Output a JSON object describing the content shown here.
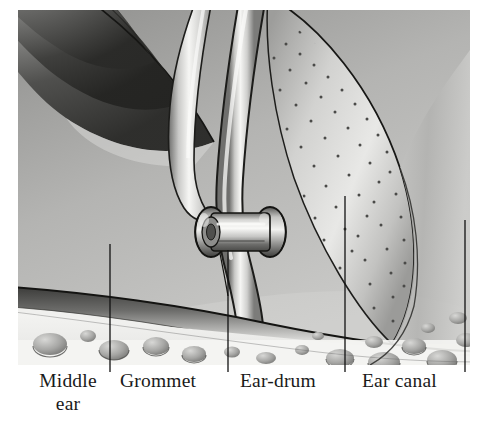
{
  "figure": {
    "type": "anatomical-illustration",
    "style": "grayscale pen-and-ink stipple drawing",
    "frame": {
      "x": 18,
      "y": 10,
      "width": 452,
      "height": 355
    }
  },
  "labels": [
    {
      "id": "middle-ear",
      "line1": "Middle",
      "line2": "ear",
      "leader": {
        "x": 110,
        "y_top": 244,
        "y_bottom": 372
      }
    },
    {
      "id": "grommet",
      "line1": "Grommet",
      "line2": "",
      "leader": {
        "x": 228,
        "y_top": 250,
        "y_bottom": 372
      }
    },
    {
      "id": "ear-drum",
      "line1": "Ear-drum",
      "line2": "",
      "leader": {
        "x": 345,
        "y_top": 196,
        "y_bottom": 372
      }
    },
    {
      "id": "ear-canal",
      "line1": "Ear canal",
      "line2": "",
      "leader": {
        "x": 465,
        "y_top": 220,
        "y_bottom": 372
      }
    }
  ],
  "parts": {
    "grommet": {
      "center_x": 240,
      "center_y": 232,
      "width": 62,
      "height": 46
    },
    "ear_drum": {
      "center_x": 360,
      "center_y": 170
    },
    "malleus_handle": {
      "label": "curved tube descending to grommet"
    },
    "mastoid_cells": {
      "label": "air-cell bubbles below bony ridge"
    }
  },
  "colors": {
    "text": "#1a1a1a",
    "leader_line": "#111111",
    "page_background": "#ffffff",
    "tissue_light": "#efefed",
    "tissue_mid": "#b9b9b7",
    "tissue_dark": "#6a6a68",
    "outline": "#202020"
  }
}
